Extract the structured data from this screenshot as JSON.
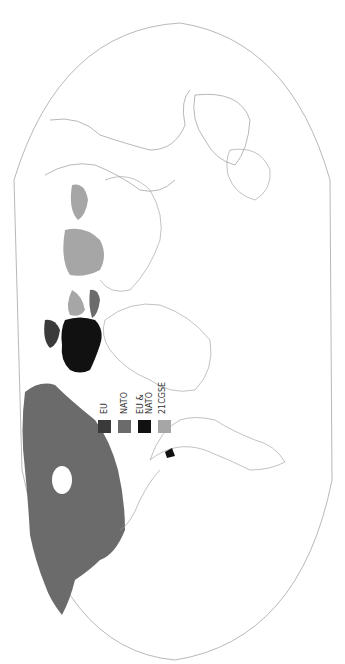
{
  "map": {
    "type": "world political map",
    "projection": "rounded world projection, rotated 90 degrees (north to the left)",
    "background": "#ffffff",
    "border_color": "#888888",
    "country_outline_color": "#999999"
  },
  "legend": {
    "items": [
      {
        "label": "EU",
        "color": "#3a3a3a"
      },
      {
        "label": "NATO",
        "color": "#6b6b6b"
      },
      {
        "label": "EU &\nNATO",
        "color": "#111111"
      },
      {
        "label": "21CGSE",
        "color": "#a6a6a6"
      }
    ]
  },
  "regions": {
    "eu": {
      "color": "#3a3a3a"
    },
    "nato": {
      "color": "#6b6b6b"
    },
    "eu_nato": {
      "color": "#111111"
    },
    "cgse": {
      "color": "#a6a6a6"
    }
  }
}
